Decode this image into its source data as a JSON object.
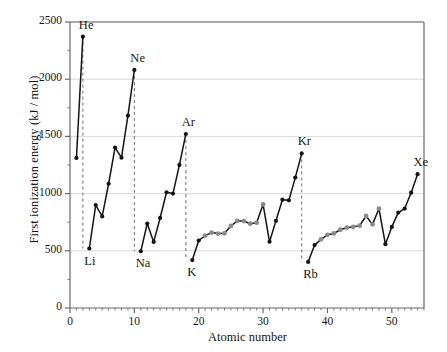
{
  "chart_data": {
    "type": "line",
    "title": "",
    "xlabel": "Atomic number",
    "ylabel": "First ionization energy (kJ / mol)",
    "xlim": [
      0,
      55
    ],
    "ylim": [
      0,
      2500
    ],
    "xticks": [
      0,
      10,
      20,
      30,
      40,
      50
    ],
    "yticks": [
      0,
      500,
      1000,
      1500,
      2000,
      2500
    ],
    "grid": "horizontal-gridlines-only",
    "legend": "none",
    "marker_colors": {
      "main_group": "#141414",
      "transition_metal": "#8a8a8a",
      "line": "#141414",
      "dropline": "#6e6e6e",
      "gridline": "#d9d9d9",
      "axis": "#6a6a6a"
    },
    "x": [
      1,
      2,
      3,
      4,
      5,
      6,
      7,
      8,
      9,
      10,
      11,
      12,
      13,
      14,
      15,
      16,
      17,
      18,
      19,
      20,
      21,
      22,
      23,
      24,
      25,
      26,
      27,
      28,
      29,
      30,
      31,
      32,
      33,
      34,
      35,
      36,
      37,
      38,
      39,
      40,
      41,
      42,
      43,
      44,
      45,
      46,
      47,
      48,
      49,
      50,
      51,
      52,
      53,
      54
    ],
    "values": [
      1312,
      2372,
      520,
      900,
      800,
      1086,
      1402,
      1314,
      1681,
      2081,
      496,
      738,
      578,
      787,
      1012,
      1000,
      1251,
      1521,
      419,
      590,
      633,
      659,
      651,
      653,
      717,
      762,
      760,
      737,
      746,
      906,
      579,
      762,
      947,
      941,
      1140,
      1351,
      403,
      550,
      600,
      640,
      652,
      684,
      702,
      710,
      720,
      804,
      731,
      868,
      558,
      709,
      834,
      869,
      1008,
      1170
    ],
    "element_symbols": [
      "H",
      "He",
      "Li",
      "Be",
      "B",
      "C",
      "N",
      "O",
      "F",
      "Ne",
      "Na",
      "Mg",
      "Al",
      "Si",
      "P",
      "S",
      "Cl",
      "Ar",
      "K",
      "Ca",
      "Sc",
      "Ti",
      "V",
      "Cr",
      "Mn",
      "Fe",
      "Co",
      "Ni",
      "Cu",
      "Zn",
      "Ga",
      "Ge",
      "As",
      "Se",
      "Br",
      "Kr",
      "Rb",
      "Sr",
      "Y",
      "Zr",
      "Nb",
      "Mo",
      "Tc",
      "Ru",
      "Rh",
      "Pd",
      "Ag",
      "Cd",
      "In",
      "Sn",
      "Sb",
      "Te",
      "I",
      "Xe"
    ],
    "transition_metal_indices": [
      20,
      21,
      22,
      23,
      24,
      25,
      26,
      27,
      28,
      29,
      38,
      39,
      40,
      41,
      42,
      43,
      44,
      45,
      46,
      47
    ],
    "annotations": [
      {
        "text": "He",
        "x": 2,
        "y": 2372,
        "placement": "above"
      },
      {
        "text": "Ne",
        "x": 10,
        "y": 2081,
        "placement": "above"
      },
      {
        "text": "Ar",
        "x": 18,
        "y": 1521,
        "placement": "above"
      },
      {
        "text": "Kr",
        "x": 36,
        "y": 1351,
        "placement": "above"
      },
      {
        "text": "Xe",
        "x": 54,
        "y": 1170,
        "placement": "above"
      },
      {
        "text": "Li",
        "x": 3,
        "y": 520,
        "placement": "below"
      },
      {
        "text": "Na",
        "x": 11,
        "y": 496,
        "placement": "below"
      },
      {
        "text": "K",
        "x": 19,
        "y": 419,
        "placement": "below"
      },
      {
        "text": "Rb",
        "x": 37,
        "y": 403,
        "placement": "below"
      }
    ],
    "droplines": [
      {
        "from_element": "He",
        "x": 2,
        "y_top": 2372,
        "y_bottom": 520
      },
      {
        "from_element": "Ne",
        "x": 10,
        "y_top": 2081,
        "y_bottom": 496
      },
      {
        "from_element": "Ar",
        "x": 18,
        "y_top": 1521,
        "y_bottom": 419
      },
      {
        "from_element": "Kr",
        "x": 36,
        "y_top": 1351,
        "y_bottom": 403
      }
    ]
  },
  "axes": {
    "y_title": "First ionization energy (kJ / mol)",
    "x_title": "Atomic number",
    "y_tick_labels": [
      "2500",
      "2000",
      "1500",
      "1000",
      "500",
      "0"
    ],
    "x_tick_labels": [
      "0",
      "10",
      "20",
      "30",
      "40",
      "50"
    ]
  }
}
